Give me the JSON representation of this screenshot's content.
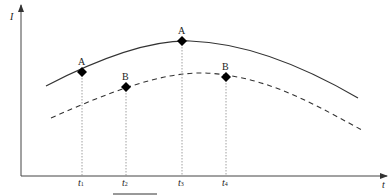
{
  "axes": {
    "y_label": "I",
    "x_label": "t"
  },
  "points": [
    {
      "label": "A",
      "curve": "solid",
      "time": "t1"
    },
    {
      "label": "B",
      "curve": "dashed",
      "time": "t2"
    },
    {
      "label": "A",
      "curve": "solid",
      "time": "t3"
    },
    {
      "label": "B",
      "curve": "dashed",
      "time": "t4"
    }
  ],
  "ticks": [
    {
      "base": "t",
      "sub": "1"
    },
    {
      "base": "t",
      "sub": "2"
    },
    {
      "base": "t",
      "sub": "3"
    },
    {
      "base": "t",
      "sub": "4"
    }
  ],
  "colors": {
    "line": "#333333",
    "marker": "#000000",
    "guide": "#888888"
  }
}
